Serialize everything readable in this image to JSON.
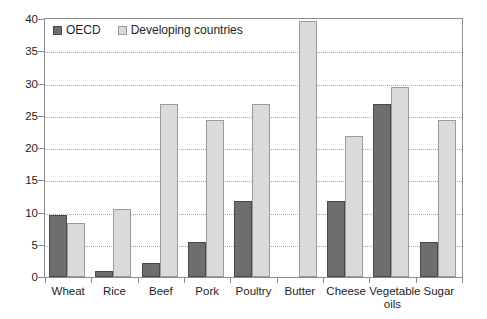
{
  "chart_data": {
    "type": "bar",
    "title": "",
    "subtitle": "",
    "xlabel": "",
    "ylabel": "",
    "ylim": [
      0,
      40
    ],
    "ytick_step": 5,
    "yticks": [
      "0",
      "5",
      "10",
      "15",
      "20",
      "25",
      "30",
      "35",
      "40"
    ],
    "grid": true,
    "grid_axis": "y",
    "legend_position": "top-left-inside",
    "categories": [
      "Wheat",
      "Rice",
      "Beef",
      "Pork",
      "Poultry",
      "Butter",
      "Cheese",
      "Vegetable\noils",
      "Sugar"
    ],
    "series": [
      {
        "name": "OECD",
        "color": "#6e6e6e",
        "border_color": "#4a4a4a",
        "values": [
          9.6,
          0.9,
          2.1,
          5.4,
          11.8,
          0,
          11.8,
          26.9,
          5.4
        ]
      },
      {
        "name": "Developing countries",
        "color": "#dadada",
        "border_color": "#9a9a9a",
        "values": [
          8.4,
          10.5,
          26.9,
          24.3,
          26.9,
          39.7,
          21.9,
          29.4,
          24.3
        ]
      }
    ]
  },
  "legend": {
    "items": [
      {
        "label": "OECD",
        "swatch": "oecd"
      },
      {
        "label": "Developing countries",
        "swatch": "dev"
      }
    ]
  },
  "colors": {
    "axis": "#8c8c8c",
    "grid": "#a8a8a8",
    "text": "#231f20",
    "background": "#ffffff",
    "series_oecd": "#6e6e6e",
    "series_developing": "#dadada"
  }
}
